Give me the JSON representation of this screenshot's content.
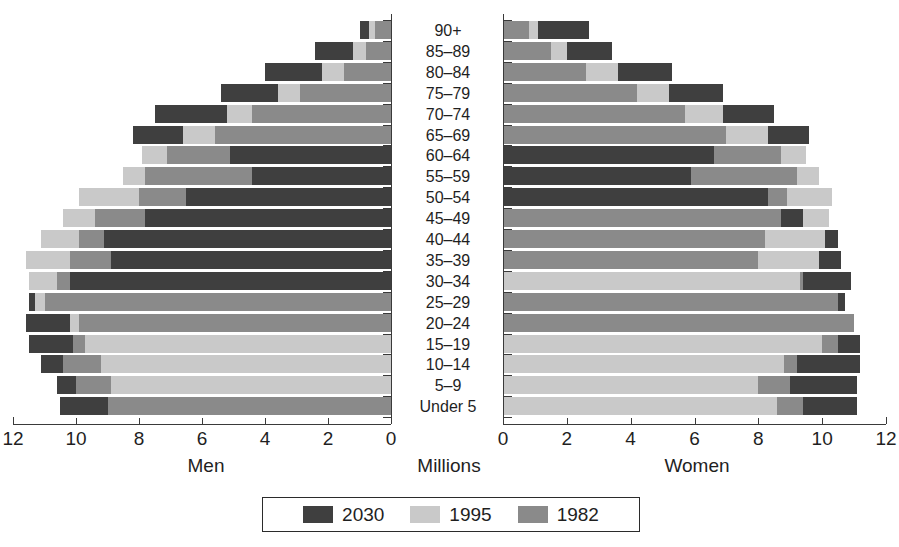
{
  "chart_data": {
    "type": "bar",
    "subtype": "population-pyramid",
    "title": "",
    "xlabel": "Millions",
    "ylabel": "",
    "left_panel_label": "Men",
    "right_panel_label": "Women",
    "grid": false,
    "legend_position": "bottom",
    "xlim_left": [
      12,
      0
    ],
    "xlim_right": [
      0,
      12
    ],
    "xticks_left": [
      "12",
      "10",
      "8",
      "6",
      "4",
      "2",
      "0"
    ],
    "xticks_right": [
      "0",
      "2",
      "4",
      "6",
      "8",
      "10",
      "12"
    ],
    "xtick_values": [
      0,
      2,
      4,
      6,
      8,
      10,
      12
    ],
    "categories": [
      "90+",
      "85–89",
      "80–84",
      "75–79",
      "70–74",
      "65–69",
      "60–64",
      "55–59",
      "50–54",
      "45–49",
      "40–44",
      "35–39",
      "30–34",
      "25–29",
      "20–24",
      "15–19",
      "10–14",
      "5–9",
      "Under 5"
    ],
    "series": [
      {
        "name": "2030",
        "color": "#3f3f3f",
        "men": [
          1.0,
          2.4,
          4.0,
          5.4,
          7.5,
          8.2,
          5.1,
          4.4,
          6.5,
          7.8,
          9.1,
          8.9,
          10.2,
          11.5,
          11.6,
          11.5,
          11.1,
          10.6,
          10.5
        ],
        "women": [
          2.7,
          3.4,
          5.3,
          6.9,
          8.5,
          9.6,
          6.6,
          5.9,
          8.3,
          9.4,
          10.5,
          10.6,
          10.9,
          10.7,
          11.0,
          11.2,
          11.2,
          11.1,
          11.1
        ]
      },
      {
        "name": "1995",
        "color": "#c9c9c9",
        "men": [
          0.7,
          1.2,
          2.2,
          3.6,
          5.2,
          6.6,
          7.9,
          8.5,
          9.9,
          10.4,
          11.1,
          11.6,
          11.5,
          11.3,
          10.2,
          9.7,
          9.2,
          8.9,
          9.0
        ],
        "women": [
          1.1,
          2.0,
          3.6,
          5.2,
          6.9,
          8.3,
          9.5,
          9.9,
          10.3,
          10.2,
          10.1,
          9.9,
          9.3,
          10.5,
          11.0,
          10.0,
          8.8,
          8.0,
          8.6
        ]
      },
      {
        "name": "1982",
        "color": "#8a8a8a",
        "men": [
          0.5,
          0.8,
          1.5,
          2.9,
          4.4,
          5.6,
          7.1,
          7.8,
          8.0,
          9.4,
          9.9,
          10.2,
          10.6,
          11.0,
          9.9,
          10.1,
          10.4,
          10.0,
          9.0
        ],
        "women": [
          0.8,
          1.5,
          2.6,
          4.2,
          5.7,
          7.0,
          8.7,
          9.2,
          8.9,
          8.7,
          8.2,
          8.0,
          9.4,
          10.5,
          11.0,
          10.5,
          9.2,
          9.0,
          9.4
        ]
      }
    ]
  },
  "legend": {
    "items": [
      {
        "label": "2030",
        "color": "#3f3f3f"
      },
      {
        "label": "1995",
        "color": "#c9c9c9"
      },
      {
        "label": "1982",
        "color": "#8a8a8a"
      }
    ]
  },
  "axis_titles": {
    "men": "Men",
    "millions": "Millions",
    "women": "Women"
  }
}
